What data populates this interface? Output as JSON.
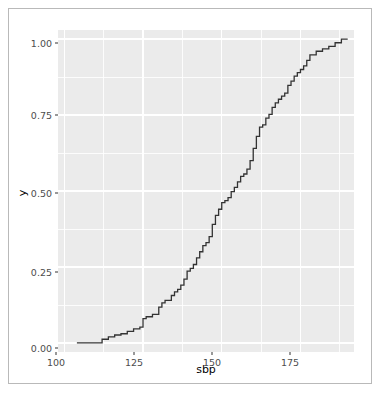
{
  "figure": {
    "background_color": "#ffffff",
    "frame_border_color": "#b9b9b9",
    "panel_background_color": "#ebebeb",
    "gridline_color": "#ffffff",
    "line_color": "#333333"
  },
  "axes": {
    "x_ticks": [
      "100",
      "125",
      "150",
      "175"
    ],
    "y_ticks": [
      "0.00",
      "0.25",
      "0.50",
      "0.75",
      "1.00"
    ],
    "x_title": "sbp",
    "y_title": "y"
  },
  "chart_data": {
    "type": "line",
    "subtype": "ecdf-step",
    "title": "",
    "xlabel": "sbp",
    "ylabel": "y",
    "xlim": [
      98,
      192
    ],
    "ylim": [
      -0.03,
      1.03
    ],
    "x_ticks": [
      100,
      125,
      150,
      175
    ],
    "y_ticks": [
      0.0,
      0.25,
      0.5,
      0.75,
      1.0
    ],
    "x_minor_ticks": [
      112.5,
      137.5,
      162.5,
      187.5
    ],
    "y_minor_ticks": [
      0.125,
      0.375,
      0.625,
      0.875
    ],
    "grid": true,
    "legend": "none",
    "series": [
      {
        "name": "ecdf(sbp)",
        "step_direction": "hv",
        "x": [
          104,
          110,
          112,
          114,
          116,
          118,
          120,
          122,
          124,
          125,
          126,
          128,
          130,
          131,
          132,
          134,
          135,
          136,
          137,
          138,
          139,
          140,
          141,
          142,
          143,
          144,
          145,
          146,
          147,
          148,
          149,
          150,
          151,
          152,
          153,
          154,
          155,
          156,
          157,
          158,
          159,
          160,
          161,
          162,
          163,
          164,
          165,
          166,
          167,
          168,
          169,
          170,
          171,
          172,
          173,
          174,
          175,
          176,
          177,
          178,
          180,
          182,
          184,
          186,
          188,
          190
        ],
        "y": [
          0.0,
          0.0,
          0.012,
          0.02,
          0.026,
          0.03,
          0.038,
          0.046,
          0.052,
          0.08,
          0.086,
          0.094,
          0.118,
          0.132,
          0.14,
          0.156,
          0.168,
          0.176,
          0.19,
          0.21,
          0.236,
          0.245,
          0.258,
          0.28,
          0.3,
          0.32,
          0.33,
          0.35,
          0.39,
          0.42,
          0.44,
          0.462,
          0.468,
          0.478,
          0.498,
          0.512,
          0.53,
          0.548,
          0.556,
          0.572,
          0.6,
          0.64,
          0.68,
          0.71,
          0.718,
          0.74,
          0.752,
          0.775,
          0.79,
          0.802,
          0.812,
          0.822,
          0.848,
          0.862,
          0.878,
          0.89,
          0.9,
          0.912,
          0.93,
          0.948,
          0.96,
          0.968,
          0.976,
          0.988,
          1.0,
          1.0
        ]
      }
    ]
  }
}
